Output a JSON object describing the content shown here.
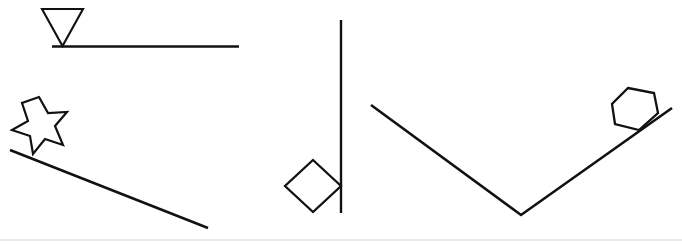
{
  "figure": {
    "width": 682,
    "height": 245,
    "background_color": "#ffffff",
    "stroke_color": "#111111",
    "bottom_rule_color": "#e9e9ec"
  },
  "panels": [
    {
      "id": "panel-left-top",
      "name": "triangle-on-horizontal-surface",
      "shape_label": "inverted triangle",
      "surface_label": "horizontal line",
      "contact": "apex touching surface"
    },
    {
      "id": "panel-left-bottom",
      "name": "star-on-descending-incline",
      "shape_label": "seven-pointed star",
      "surface_label": "descending inclined line",
      "contact": "lower point touching incline"
    },
    {
      "id": "panel-middle",
      "name": "diamond-against-vertical-line",
      "shape_label": "diamond",
      "surface_label": "vertical line",
      "contact": "right vertex touching vertical line"
    },
    {
      "id": "panel-right",
      "name": "hexagon-on-v-shaped-surface",
      "shape_label": "hexagon",
      "surface_label": "v-shaped line",
      "contact": "bottom vertex touching right arm of v"
    }
  ],
  "geometry": {
    "triangle": {
      "points": "42,9 83,9 62.5,46",
      "stroke_width": 2.1
    },
    "horizontal_surface": {
      "x1": 52,
      "y1": 46.5,
      "x2": 239,
      "y2": 46.5,
      "stroke_width": 2.4
    },
    "star": {
      "points": "39,97 48,113 67,112 55,126 63,145 45,139 33,154 30,136 12,130 28,121 22,103",
      "stroke_width": 2.2
    },
    "incline_surface": {
      "x1": 10,
      "y1": 150,
      "x2": 208,
      "y2": 228,
      "stroke_width": 2.6
    },
    "diamond": {
      "points": "313,160 341,186 313,212 285,186",
      "stroke_width": 2.3
    },
    "vertical_surface": {
      "x1": 341,
      "y1": 20,
      "x2": 341,
      "y2": 213,
      "stroke_width": 2.4
    },
    "v_surface": {
      "points": "371,105 521,215 672,108",
      "stroke_width": 2.6
    },
    "hexagon": {
      "points": "628,88 654,93 658,113 639,130 615,124 612,104",
      "stroke_width": 2.3
    },
    "bottom_rule": {
      "x1": 0,
      "y1": 240,
      "x2": 682,
      "y2": 240
    }
  }
}
